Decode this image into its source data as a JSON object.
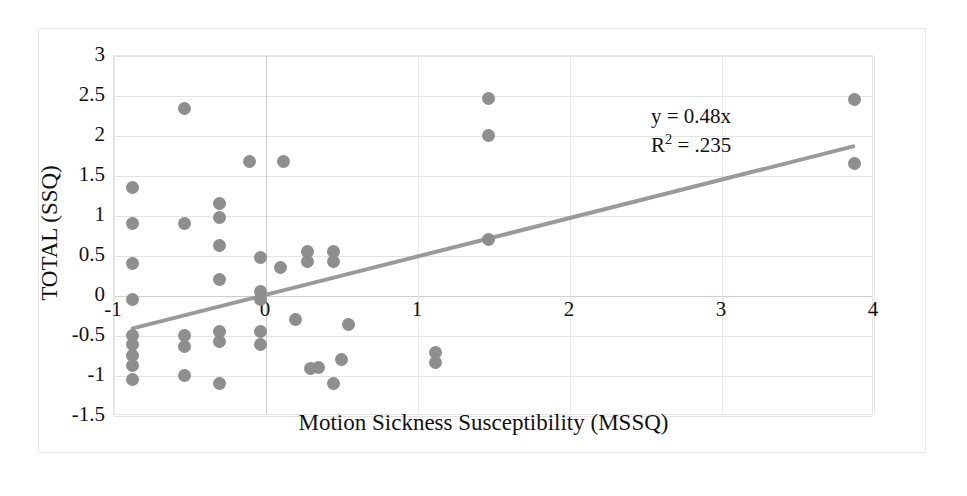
{
  "chart_data": {
    "type": "scatter",
    "title": "",
    "xlabel": "Motion Sickness Susceptibility (MSSQ)",
    "ylabel": "TOTAL (SSQ)",
    "xlim": [
      -1,
      4
    ],
    "ylim": [
      -1.5,
      3
    ],
    "xticks": [
      "-1",
      "0",
      "1",
      "2",
      "3",
      "4"
    ],
    "xtick_values": [
      -1,
      0,
      1,
      2,
      3,
      4
    ],
    "yticks": [
      "3",
      "2.5",
      "2",
      "1.5",
      "1",
      "0.5",
      "0",
      "-0.5",
      "-1",
      "-1.5"
    ],
    "ytick_values": [
      3,
      2.5,
      2,
      1.5,
      1,
      0.5,
      0,
      -0.5,
      -1,
      -1.5
    ],
    "grid": true,
    "legend": "none",
    "marker_color": "#8e8e8e",
    "trendline_color": "#9a9a9a",
    "annotations": {
      "equation": "y = 0.48x",
      "r_squared_label": "R",
      "r_squared_sup": "2",
      "r_squared_value": " = .235"
    },
    "trendline": {
      "slope": 0.48,
      "intercept": 0,
      "x_start": -0.87,
      "x_end": 3.87
    },
    "points": [
      [
        -0.53,
        2.33
      ],
      [
        -0.87,
        1.35
      ],
      [
        -0.87,
        0.9
      ],
      [
        -0.53,
        0.9
      ],
      [
        -0.87,
        0.4
      ],
      [
        -0.87,
        -0.05
      ],
      [
        -0.87,
        -0.5
      ],
      [
        -0.87,
        -0.62
      ],
      [
        -0.87,
        -0.75
      ],
      [
        -0.87,
        -0.88
      ],
      [
        -0.87,
        -1.05
      ],
      [
        -0.53,
        -0.5
      ],
      [
        -0.53,
        -0.64
      ],
      [
        -0.53,
        -1.0
      ],
      [
        -0.3,
        1.15
      ],
      [
        -0.3,
        0.97
      ],
      [
        -0.3,
        0.62
      ],
      [
        -0.3,
        0.2
      ],
      [
        -0.3,
        -0.46
      ],
      [
        -0.3,
        -0.58
      ],
      [
        -0.3,
        -1.1
      ],
      [
        -0.1,
        1.67
      ],
      [
        -0.03,
        0.47
      ],
      [
        -0.03,
        0.05
      ],
      [
        -0.03,
        -0.06
      ],
      [
        -0.03,
        -0.45
      ],
      [
        -0.03,
        -0.62
      ],
      [
        0.12,
        1.67
      ],
      [
        0.28,
        0.55
      ],
      [
        0.28,
        0.42
      ],
      [
        0.1,
        0.35
      ],
      [
        0.2,
        -0.3
      ],
      [
        0.35,
        -0.9
      ],
      [
        0.3,
        -0.92
      ],
      [
        0.45,
        -1.1
      ],
      [
        0.45,
        0.55
      ],
      [
        0.45,
        0.42
      ],
      [
        0.55,
        -0.37
      ],
      [
        0.5,
        -0.8
      ],
      [
        1.12,
        -0.72
      ],
      [
        1.12,
        -0.84
      ],
      [
        1.47,
        2.46
      ],
      [
        1.47,
        2.0
      ],
      [
        1.47,
        0.7
      ],
      [
        3.88,
        2.45
      ],
      [
        3.88,
        1.65
      ]
    ]
  },
  "axis_title_x": "Motion Sickness Susceptibility (MSSQ)",
  "axis_title_y": "TOTAL (SSQ)"
}
